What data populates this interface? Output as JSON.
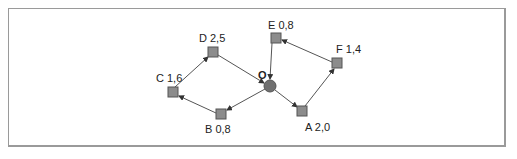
{
  "diagram": {
    "type": "directed-graph",
    "center_node": {
      "id": "O",
      "label": "O"
    },
    "nodes": [
      {
        "id": "A",
        "label": "A 2,0",
        "value": "2,0"
      },
      {
        "id": "B",
        "label": "B 0,8",
        "value": "0,8"
      },
      {
        "id": "C",
        "label": "C 1,6",
        "value": "1,6"
      },
      {
        "id": "D",
        "label": "D 2,5",
        "value": "2,5"
      },
      {
        "id": "E",
        "label": "E 0,8",
        "value": "0,8"
      },
      {
        "id": "F",
        "label": "F 1,4",
        "value": "1,4"
      }
    ],
    "edges": [
      {
        "from": "O",
        "to": "B"
      },
      {
        "from": "B",
        "to": "C"
      },
      {
        "from": "C",
        "to": "D"
      },
      {
        "from": "D",
        "to": "O"
      },
      {
        "from": "O",
        "to": "A"
      },
      {
        "from": "A",
        "to": "F"
      },
      {
        "from": "F",
        "to": "E"
      },
      {
        "from": "E",
        "to": "O"
      }
    ],
    "colors": {
      "node_fill": "#8c8c8c",
      "node_stroke": "#555555",
      "center_fill": "#707070",
      "edge": "#444444",
      "frame": "#9a9a9a"
    }
  }
}
